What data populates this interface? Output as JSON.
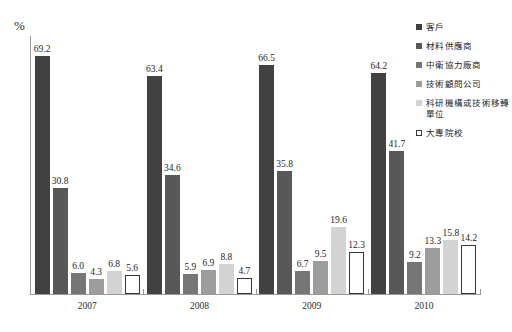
{
  "chart_data": {
    "type": "bar",
    "title": "",
    "subtitle": "",
    "xlabel": "",
    "ylabel": "%",
    "ylim": [
      0,
      75
    ],
    "grid": false,
    "legend_position": "top-right",
    "categories": [
      "2007",
      "2008",
      "2009",
      "2010"
    ],
    "series": [
      {
        "name": "客戶",
        "color": "#414141",
        "border": "#414141",
        "values": [
          69.2,
          63.4,
          66.5,
          64.2
        ],
        "labels": [
          "69.2",
          "63.4",
          "66.5",
          "64.2"
        ]
      },
      {
        "name": "材料供應商",
        "color": "#585858",
        "border": "#585858",
        "values": [
          30.8,
          34.6,
          35.8,
          41.7
        ],
        "labels": [
          "30.8",
          "34.6",
          "35.8",
          "41.7"
        ]
      },
      {
        "name": "中衛協力廠商",
        "color": "#767676",
        "border": "#767676",
        "values": [
          6.0,
          5.9,
          6.7,
          9.2
        ],
        "labels": [
          "6.0",
          "5.9",
          "6.7",
          "9.2"
        ]
      },
      {
        "name": "技術顧問公司",
        "color": "#9d9d9d",
        "border": "#9d9d9d",
        "values": [
          4.3,
          6.9,
          9.5,
          13.3
        ],
        "labels": [
          "4.3",
          "6.9",
          "9.5",
          "13.3"
        ]
      },
      {
        "name": "科研機構或技術移轉單位",
        "color": "#d3d3d3",
        "border": "#d3d3d3",
        "values": [
          6.8,
          8.8,
          19.6,
          15.8
        ],
        "labels": [
          "6.8",
          "8.8",
          "19.6",
          "15.8"
        ]
      },
      {
        "name": "大專院校",
        "color": "#ffffff",
        "border": "#3a3a3a",
        "values": [
          5.6,
          4.7,
          12.3,
          14.2
        ],
        "labels": [
          "5.6",
          "4.7",
          "12.3",
          "14.2"
        ]
      }
    ]
  },
  "axis": {
    "y_unit_label": "%",
    "x_tick_labels": [
      "2007",
      "2008",
      "2009",
      "2010"
    ]
  },
  "legend": {
    "items": [
      {
        "label": "客戶",
        "marker": "filled-square",
        "color": "#414141"
      },
      {
        "label": "材料供應商",
        "marker": "filled-square",
        "color": "#585858"
      },
      {
        "label": "中衛協力廠商",
        "marker": "filled-square",
        "color": "#767676"
      },
      {
        "label": "技術顧問公司",
        "marker": "filled-square",
        "color": "#9d9d9d"
      },
      {
        "label": "科研機構或技術移轉單位",
        "marker": "filled-square",
        "color": "#d3d3d3"
      },
      {
        "label": "大專院校",
        "marker": "hollow-square",
        "color": "#ffffff"
      }
    ]
  }
}
